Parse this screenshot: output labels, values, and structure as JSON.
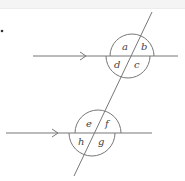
{
  "diagram": {
    "type": "parallel-lines-transversal",
    "stroke_color": "#777777",
    "label_color": "#444444",
    "top_intersection": {
      "angles": {
        "top_left": "a",
        "top_right": "b",
        "bottom_right": "c",
        "bottom_left": "d"
      }
    },
    "bottom_intersection": {
      "angles": {
        "top_left": "e",
        "top_right": "f",
        "bottom_right": "g",
        "bottom_left": "h"
      }
    },
    "bullet": "•"
  }
}
